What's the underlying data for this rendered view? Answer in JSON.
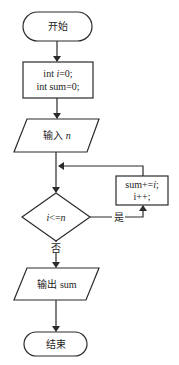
{
  "flowchart": {
    "start": {
      "label": "开始"
    },
    "init": {
      "line1_prefix": "int ",
      "line1_var": "i",
      "line1_suffix": "=0;",
      "line2": "int sum=0;"
    },
    "input": {
      "label": "输入 ",
      "var": "n"
    },
    "condition": {
      "var_i": "i",
      "op": "<=",
      "var_n": "n"
    },
    "loop_body": {
      "line1_prefix": "sum+=",
      "line1_var": "i",
      "line1_suffix": ";",
      "line2": "i++;"
    },
    "yes_label": "是",
    "no_label": "否",
    "output": {
      "label": "输出 sum"
    },
    "end": {
      "label": "结束"
    }
  }
}
